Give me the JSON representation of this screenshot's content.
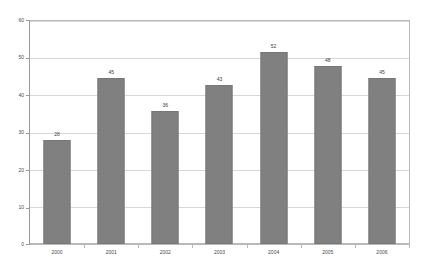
{
  "chart_data": {
    "type": "bar",
    "title": "",
    "subtitle": "",
    "xlabel": "",
    "ylabel": "",
    "categories": [
      "2000",
      "2001",
      "2002",
      "2003",
      "2004",
      "2005",
      "2006"
    ],
    "values": [
      28,
      45,
      36,
      43,
      52,
      48,
      45
    ],
    "data_labels": [
      "28",
      "45",
      "36",
      "43",
      "52",
      "48",
      "45"
    ],
    "ylim": [
      0,
      60
    ],
    "yticks": [
      0,
      10,
      20,
      30,
      40,
      50,
      60
    ],
    "ytick_labels": [
      "0",
      "10",
      "20",
      "30",
      "40",
      "50",
      "60"
    ],
    "grid": true,
    "grid_axis": "y",
    "legend": false,
    "legend_position": "none",
    "series": [
      {
        "name": "",
        "values": [
          28,
          45,
          36,
          43,
          52,
          48,
          45
        ]
      }
    ]
  },
  "style": {
    "bar_color": "#808080",
    "bar_border_color": "#777777",
    "grid_color": "#d8d8d8",
    "frame_color": "#b9b9b9",
    "axis_color": "#9a9a9a",
    "label_color": "#4a4a4a",
    "value_label_color": "#3d3d3d",
    "background": "#ffffff"
  }
}
